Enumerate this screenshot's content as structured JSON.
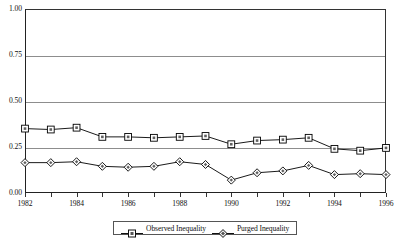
{
  "chart_data": {
    "type": "line",
    "title": "",
    "subtitle": "",
    "xlabel": "",
    "ylabel": "",
    "x": [
      1982,
      1983,
      1984,
      1985,
      1986,
      1987,
      1988,
      1989,
      1990,
      1991,
      1992,
      1993,
      1994,
      1995,
      1996
    ],
    "xlim": [
      1982,
      1996
    ],
    "ylim": [
      0.0,
      1.0
    ],
    "yticks": [
      0.0,
      0.25,
      0.5,
      0.75,
      1.0
    ],
    "ytick_labels": [
      "0.00",
      "0.25",
      "0.50",
      "0.75",
      "1.00"
    ],
    "xticks": [
      1982,
      1983,
      1984,
      1985,
      1986,
      1987,
      1988,
      1989,
      1990,
      1991,
      1992,
      1993,
      1994,
      1995,
      1996
    ],
    "xtick_labels": [
      "1982",
      "",
      "1984",
      "",
      "1986",
      "",
      "1988",
      "",
      "1990",
      "",
      "1992",
      "",
      "1994",
      "",
      "1996"
    ],
    "grid": "horizontal",
    "legend_position": "bottom",
    "series": [
      {
        "name": "Observed Inequality",
        "marker": "square",
        "color": "#000000",
        "values": [
          0.35,
          0.345,
          0.355,
          0.305,
          0.305,
          0.3,
          0.305,
          0.31,
          0.265,
          0.285,
          0.29,
          0.3,
          0.24,
          0.23,
          0.245
        ]
      },
      {
        "name": "Purged Inequality",
        "marker": "diamond",
        "color": "#000000",
        "values": [
          0.165,
          0.165,
          0.17,
          0.145,
          0.14,
          0.145,
          0.17,
          0.155,
          0.07,
          0.11,
          0.12,
          0.15,
          0.1,
          0.105,
          0.1
        ]
      }
    ]
  },
  "legend": {
    "items": [
      {
        "label": "Observed Inequality",
        "marker": "square"
      },
      {
        "label": "Purged Inequality",
        "marker": "diamond"
      }
    ]
  }
}
